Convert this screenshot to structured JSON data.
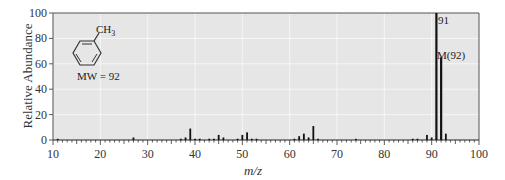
{
  "chart_data": {
    "type": "bar",
    "title": "",
    "xlabel": "m/z",
    "ylabel": "Relative Abundance",
    "xlim": [
      10,
      100
    ],
    "ylim": [
      0,
      100
    ],
    "xticks": [
      10,
      20,
      30,
      40,
      50,
      60,
      70,
      80,
      90,
      100
    ],
    "yticks": [
      0,
      20,
      40,
      60,
      80,
      100
    ],
    "grid": true,
    "legend": null,
    "peaks": [
      {
        "mz": 11,
        "abundance": 0.5
      },
      {
        "mz": 27,
        "abundance": 2
      },
      {
        "mz": 37,
        "abundance": 1
      },
      {
        "mz": 38,
        "abundance": 2
      },
      {
        "mz": 39,
        "abundance": 9
      },
      {
        "mz": 40,
        "abundance": 1
      },
      {
        "mz": 41,
        "abundance": 1
      },
      {
        "mz": 43,
        "abundance": 1
      },
      {
        "mz": 44,
        "abundance": 1
      },
      {
        "mz": 45,
        "abundance": 4
      },
      {
        "mz": 46,
        "abundance": 2
      },
      {
        "mz": 49,
        "abundance": 1
      },
      {
        "mz": 50,
        "abundance": 4
      },
      {
        "mz": 51,
        "abundance": 6
      },
      {
        "mz": 52,
        "abundance": 1
      },
      {
        "mz": 53,
        "abundance": 1
      },
      {
        "mz": 61,
        "abundance": 1
      },
      {
        "mz": 62,
        "abundance": 3
      },
      {
        "mz": 63,
        "abundance": 5
      },
      {
        "mz": 64,
        "abundance": 2
      },
      {
        "mz": 65,
        "abundance": 11
      },
      {
        "mz": 66,
        "abundance": 1
      },
      {
        "mz": 74,
        "abundance": 0.5
      },
      {
        "mz": 86,
        "abundance": 1
      },
      {
        "mz": 87,
        "abundance": 1
      },
      {
        "mz": 89,
        "abundance": 4
      },
      {
        "mz": 90,
        "abundance": 2
      },
      {
        "mz": 91,
        "abundance": 100
      },
      {
        "mz": 92,
        "abundance": 65
      },
      {
        "mz": 93,
        "abundance": 5
      }
    ],
    "annotations": [
      {
        "text": "91",
        "mz": 91,
        "abundance": 100
      },
      {
        "text": "M(92)",
        "mz": 92,
        "abundance": 65
      }
    ],
    "inset": {
      "molecule": "toluene",
      "substituent_label": "CH3",
      "mw_label": "MW = 92"
    }
  },
  "labels": {
    "ylabel": "Relative Abundance",
    "xlabel_m": "m",
    "xlabel_z": "/z",
    "ch3": "CH",
    "ch3_sub": "3",
    "mw": "MW = 92",
    "peak91": "91",
    "peakM": "M(92)"
  },
  "style": {
    "plot_bg": "#e6e6e6",
    "grid_color": "#f6f6f6",
    "bar_color": "#111111",
    "axis_color": "#555555"
  }
}
